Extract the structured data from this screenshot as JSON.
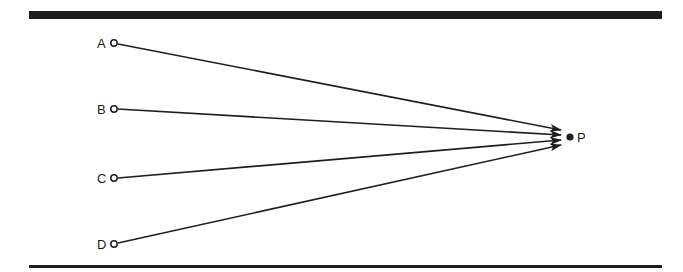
{
  "diagram": {
    "type": "convergent-rays",
    "colors": {
      "ink": "#1e1e1e",
      "background": "#ffffff"
    },
    "source_points": [
      {
        "id": "A",
        "label": "A",
        "x": 114,
        "y": 43
      },
      {
        "id": "B",
        "label": "B",
        "x": 114,
        "y": 109
      },
      {
        "id": "C",
        "label": "C",
        "x": 114,
        "y": 178
      },
      {
        "id": "D",
        "label": "D",
        "x": 114,
        "y": 244
      }
    ],
    "target_point": {
      "id": "P",
      "label": "P",
      "x": 570,
      "y": 137
    },
    "arrows": [
      {
        "from": "A",
        "to": "P"
      },
      {
        "from": "B",
        "to": "P"
      },
      {
        "from": "C",
        "to": "P"
      },
      {
        "from": "D",
        "to": "P"
      }
    ]
  },
  "labels": {
    "a": "A",
    "b": "B",
    "c": "C",
    "d": "D",
    "p": "P"
  }
}
